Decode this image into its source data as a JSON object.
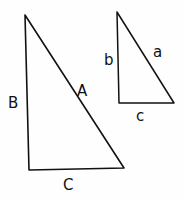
{
  "diagram": {
    "large_triangle": {
      "vertices": [
        [
          25,
          15
        ],
        [
          29,
          170
        ],
        [
          124,
          168
        ]
      ],
      "labels": {
        "vertical_side": "B",
        "hypotenuse": "A",
        "base": "C"
      }
    },
    "small_triangle": {
      "vertices": [
        [
          117,
          12
        ],
        [
          119,
          103
        ],
        [
          174,
          103
        ]
      ],
      "labels": {
        "vertical_side": "b",
        "hypotenuse": "a",
        "base": "c"
      }
    },
    "stroke_color": "#111111",
    "background": "#fefefe"
  }
}
